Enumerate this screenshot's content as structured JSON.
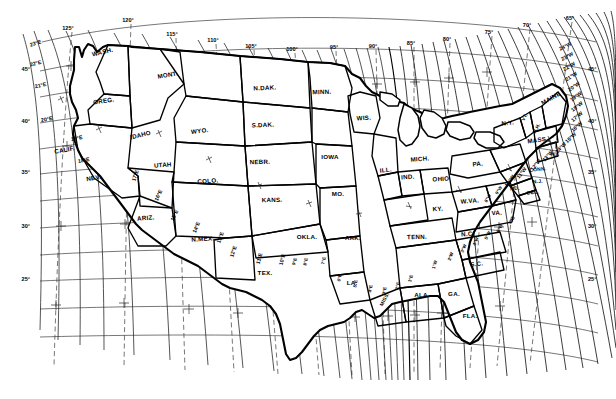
{
  "chart_data": {
    "type": "map",
    "subtitle": "Lines of equal magnetic declination (variation) east and west of true north",
    "projection": "conic",
    "xlabel": "Longitude (West)",
    "ylabel": "Latitude (North)",
    "grid": true,
    "legend_position": "none",
    "xlim": [
      -127,
      -64
    ],
    "ylim": [
      23,
      50
    ],
    "longitude_ticks": [
      "125°",
      "120°",
      "115°",
      "110°",
      "105°",
      "100°",
      "95°",
      "90°",
      "85°",
      "80°",
      "75°",
      "70°",
      "65°"
    ],
    "latitude_ticks_left": [
      "45°",
      "40°",
      "35°",
      "30°",
      "25°"
    ],
    "latitude_ticks_right": [
      "45°",
      "40°",
      "35°",
      "30°",
      "25°"
    ],
    "declination_east_labels": [
      "23°E",
      "22°E",
      "21°E",
      "20°E",
      "19°E",
      "18°E",
      "17°E",
      "16°E",
      "15°E",
      "14°E",
      "13°E",
      "12°E",
      "11°E",
      "10°E",
      "9°E",
      "8°E",
      "7°E",
      "6°E",
      "5°E",
      "4°E",
      "3°E",
      "2°E",
      "1°E"
    ],
    "declination_west_labels": [
      "1°W",
      "2°W",
      "3°W",
      "4°W",
      "5°W",
      "6°W",
      "7°W",
      "8°W",
      "9°W",
      "10°W",
      "11°W",
      "12°W",
      "13°W",
      "14°W",
      "15°W",
      "16°W",
      "17°W",
      "18°W",
      "19°W",
      "20°W",
      "21°W",
      "22°W",
      "23°W",
      "24°W"
    ],
    "agonic_line": "0° — runs from Lake Michigan south through Illinois, western Kentucky, Tennessee and Mississippi to the Gulf Coast",
    "series": [
      {
        "name": "East declination isogonics",
        "values": [
          23,
          22,
          21,
          20,
          19,
          18,
          17,
          16,
          15,
          14,
          13,
          12,
          11,
          10,
          9,
          8,
          7,
          6,
          5,
          4,
          3,
          2,
          1
        ]
      },
      {
        "name": "Agonic line",
        "values": [
          0
        ]
      },
      {
        "name": "West declination isogonics",
        "values": [
          -1,
          -2,
          -3,
          -4,
          -5,
          -6,
          -7,
          -8,
          -9,
          -10,
          -11,
          -12,
          -13,
          -14,
          -15,
          -16,
          -17,
          -18,
          -19,
          -20,
          -21,
          -22,
          -23,
          -24
        ]
      }
    ]
  },
  "axis": {
    "top": [
      {
        "label": "125°",
        "x": 68,
        "y": 30
      },
      {
        "label": "120°",
        "x": 128,
        "y": 22
      },
      {
        "label": "115°",
        "x": 172,
        "y": 36
      },
      {
        "label": "110°",
        "x": 213,
        "y": 42
      },
      {
        "label": "105°",
        "x": 251,
        "y": 48
      },
      {
        "label": "100°",
        "x": 292,
        "y": 51
      },
      {
        "label": "95°",
        "x": 334,
        "y": 49
      },
      {
        "label": "90°",
        "x": 373,
        "y": 48
      },
      {
        "label": "85°",
        "x": 411,
        "y": 45
      },
      {
        "label": "80°",
        "x": 447,
        "y": 41
      },
      {
        "label": "75°",
        "x": 489,
        "y": 34
      },
      {
        "label": "70°",
        "x": 527,
        "y": 27
      },
      {
        "label": "65°",
        "x": 570,
        "y": 20
      }
    ],
    "left": [
      {
        "label": "45°",
        "x": 30,
        "y": 71
      },
      {
        "label": "40°",
        "x": 30,
        "y": 123
      },
      {
        "label": "35°",
        "x": 30,
        "y": 174
      },
      {
        "label": "30°",
        "x": 30,
        "y": 228
      },
      {
        "label": "25°",
        "x": 30,
        "y": 281
      }
    ],
    "right": [
      {
        "label": "45°",
        "x": 588,
        "y": 71
      },
      {
        "label": "40°",
        "x": 588,
        "y": 123
      },
      {
        "label": "35°",
        "x": 588,
        "y": 174
      },
      {
        "label": "30°",
        "x": 588,
        "y": 228
      },
      {
        "label": "25°",
        "x": 588,
        "y": 281
      }
    ]
  },
  "states": [
    {
      "abbr": "WASH.",
      "x": 103,
      "y": 54,
      "rot": -13,
      "size": "n"
    },
    {
      "abbr": "OREG.",
      "x": 104,
      "y": 103,
      "rot": -8,
      "size": "n"
    },
    {
      "abbr": "CALIF.",
      "x": 65,
      "y": 152,
      "rot": -10,
      "size": "n"
    },
    {
      "abbr": "NEV.",
      "x": 94,
      "y": 180,
      "rot": -10,
      "size": "n"
    },
    {
      "abbr": "IDAHO",
      "x": 141,
      "y": 137,
      "rot": -14,
      "size": "n"
    },
    {
      "abbr": "MONT.",
      "x": 168,
      "y": 77,
      "rot": -10,
      "size": "n"
    },
    {
      "abbr": "WYO.",
      "x": 200,
      "y": 133,
      "rot": -6,
      "size": "n"
    },
    {
      "abbr": "UTAH",
      "x": 163,
      "y": 167,
      "rot": -5,
      "size": "n"
    },
    {
      "abbr": "COLO.",
      "x": 208,
      "y": 183,
      "rot": -4,
      "size": "n"
    },
    {
      "abbr": "ARIZ.",
      "x": 146,
      "y": 220,
      "rot": -5,
      "size": "n"
    },
    {
      "abbr": "N.MEX.",
      "x": 203,
      "y": 241,
      "rot": -4,
      "size": "n"
    },
    {
      "abbr": "N.DAK.",
      "x": 265,
      "y": 90,
      "rot": -3,
      "size": "n"
    },
    {
      "abbr": "S.DAK.",
      "x": 263,
      "y": 127,
      "rot": -2,
      "size": "n"
    },
    {
      "abbr": "NEBR.",
      "x": 260,
      "y": 164,
      "rot": -2,
      "size": "n"
    },
    {
      "abbr": "KANS.",
      "x": 272,
      "y": 202,
      "rot": -1,
      "size": "n"
    },
    {
      "abbr": "OKLA.",
      "x": 307,
      "y": 239,
      "rot": 0,
      "size": "n"
    },
    {
      "abbr": "TEX.",
      "x": 265,
      "y": 275,
      "rot": 0,
      "size": "n"
    },
    {
      "abbr": "MINN.",
      "x": 322,
      "y": 94,
      "rot": -2,
      "size": "n"
    },
    {
      "abbr": "IOWA",
      "x": 330,
      "y": 159,
      "rot": 0,
      "size": "n"
    },
    {
      "abbr": "MO.",
      "x": 338,
      "y": 196,
      "rot": 0,
      "size": "n"
    },
    {
      "abbr": "ARK.",
      "x": 353,
      "y": 240,
      "rot": 0,
      "size": "n"
    },
    {
      "abbr": "LA.",
      "x": 352,
      "y": 285,
      "rot": 0,
      "size": "n"
    },
    {
      "abbr": "MISS.",
      "x": 386,
      "y": 300,
      "rot": -62,
      "size": "sm"
    },
    {
      "abbr": "WIS.",
      "x": 364,
      "y": 120,
      "rot": -4,
      "size": "n"
    },
    {
      "abbr": "ILL.",
      "x": 386,
      "y": 172,
      "rot": -6,
      "size": "n"
    },
    {
      "abbr": "IND.",
      "x": 408,
      "y": 179,
      "rot": -4,
      "size": "n"
    },
    {
      "abbr": "MICH.",
      "x": 420,
      "y": 161,
      "rot": -4,
      "size": "n"
    },
    {
      "abbr": "OHIO",
      "x": 441,
      "y": 181,
      "rot": -3,
      "size": "n"
    },
    {
      "abbr": "KY.",
      "x": 438,
      "y": 211,
      "rot": -4,
      "size": "n"
    },
    {
      "abbr": "TENN.",
      "x": 417,
      "y": 239,
      "rot": -2,
      "size": "n"
    },
    {
      "abbr": "ALA.",
      "x": 422,
      "y": 297,
      "rot": 0,
      "size": "n"
    },
    {
      "abbr": "GA.",
      "x": 454,
      "y": 296,
      "rot": 0,
      "size": "n"
    },
    {
      "abbr": "FLA.",
      "x": 470,
      "y": 318,
      "rot": 0,
      "size": "n"
    },
    {
      "abbr": "S.C.",
      "x": 477,
      "y": 266,
      "rot": -6,
      "size": "n"
    },
    {
      "abbr": "N.C.",
      "x": 468,
      "y": 236,
      "rot": -4,
      "size": "n"
    },
    {
      "abbr": "VA.",
      "x": 497,
      "y": 215,
      "rot": -4,
      "size": "n"
    },
    {
      "abbr": "W.VA.",
      "x": 470,
      "y": 203,
      "rot": -4,
      "size": "n"
    },
    {
      "abbr": "PA.",
      "x": 478,
      "y": 166,
      "rot": -5,
      "size": "n"
    },
    {
      "abbr": "N.Y.",
      "x": 508,
      "y": 125,
      "rot": -7,
      "size": "n"
    },
    {
      "abbr": "VT.",
      "x": 526,
      "y": 118,
      "rot": -62,
      "size": "sm"
    },
    {
      "abbr": "N.H.",
      "x": 538,
      "y": 129,
      "rot": -62,
      "size": "sm"
    },
    {
      "abbr": "MAINE",
      "x": 552,
      "y": 100,
      "rot": -30,
      "size": "n"
    },
    {
      "abbr": "MASS.",
      "x": 538,
      "y": 142,
      "rot": -8,
      "size": "n"
    },
    {
      "abbr": "CONN.",
      "x": 538,
      "y": 171,
      "rot": -6,
      "size": "sm"
    },
    {
      "abbr": "R.I.",
      "x": 555,
      "y": 156,
      "rot": -6,
      "size": "sm"
    },
    {
      "abbr": "N.J.",
      "x": 538,
      "y": 183,
      "rot": -6,
      "size": "sm"
    },
    {
      "abbr": "DEL.",
      "x": 533,
      "y": 194,
      "rot": -6,
      "size": "sm"
    },
    {
      "abbr": "MD.",
      "x": 515,
      "y": 190,
      "rot": -6,
      "size": "sm"
    }
  ],
  "isogonic_labels": [
    {
      "label": "23°E",
      "x": 36,
      "y": 45,
      "rot": -17
    },
    {
      "label": "22°E",
      "x": 36,
      "y": 65,
      "rot": -14
    },
    {
      "label": "21°E",
      "x": 41,
      "y": 87,
      "rot": -13
    },
    {
      "label": "20°E",
      "x": 47,
      "y": 121,
      "rot": -10
    },
    {
      "label": "19°E",
      "x": 77,
      "y": 140,
      "rot": -10
    },
    {
      "label": "18°E",
      "x": 84,
      "y": 162,
      "rot": -10
    },
    {
      "label": "17°E",
      "x": 137,
      "y": 176,
      "rot": -72
    },
    {
      "label": "16°E",
      "x": 160,
      "y": 196,
      "rot": -66
    },
    {
      "label": "15°E",
      "x": 176,
      "y": 216,
      "rot": -66
    },
    {
      "label": "14°E",
      "x": 198,
      "y": 228,
      "rot": -68
    },
    {
      "label": "13°E",
      "x": 222,
      "y": 238,
      "rot": -70
    },
    {
      "label": "12°E",
      "x": 235,
      "y": 252,
      "rot": -72
    },
    {
      "label": "11°E",
      "x": 261,
      "y": 259,
      "rot": -74
    },
    {
      "label": "10°E",
      "x": 284,
      "y": 260,
      "rot": -76
    },
    {
      "label": "9°E",
      "x": 296,
      "y": 262,
      "rot": -76
    },
    {
      "label": "8°E",
      "x": 307,
      "y": 262,
      "rot": -78
    },
    {
      "label": "7°E",
      "x": 325,
      "y": 261,
      "rot": -78
    },
    {
      "label": "6°E",
      "x": 341,
      "y": 278,
      "rot": -80
    },
    {
      "label": "5°E",
      "x": 357,
      "y": 284,
      "rot": -80
    },
    {
      "label": "4°E",
      "x": 372,
      "y": 289,
      "rot": -80
    },
    {
      "label": "3°E",
      "x": 386,
      "y": 291,
      "rot": -80
    },
    {
      "label": "2°E",
      "x": 399,
      "y": 286,
      "rot": -78
    },
    {
      "label": "1°E",
      "x": 412,
      "y": 279,
      "rot": -76
    },
    {
      "label": "1°W",
      "x": 436,
      "y": 265,
      "rot": -72
    },
    {
      "label": "2°W",
      "x": 452,
      "y": 257,
      "rot": -70
    },
    {
      "label": "3°W",
      "x": 465,
      "y": 249,
      "rot": -68
    },
    {
      "label": "4°W",
      "x": 477,
      "y": 242,
      "rot": -66
    },
    {
      "label": "5°W",
      "x": 489,
      "y": 236,
      "rot": -64
    },
    {
      "label": "6°W",
      "x": 501,
      "y": 229,
      "rot": -62
    },
    {
      "label": "7°W",
      "x": 513,
      "y": 221,
      "rot": -60
    },
    {
      "label": "8°W",
      "x": 489,
      "y": 199,
      "rot": -58
    },
    {
      "label": "9°W",
      "x": 500,
      "y": 191,
      "rot": -56
    },
    {
      "label": "10°W",
      "x": 511,
      "y": 182,
      "rot": -54
    },
    {
      "label": "11°W",
      "x": 523,
      "y": 174,
      "rot": -52
    },
    {
      "label": "12°W",
      "x": 537,
      "y": 166,
      "rot": -50
    },
    {
      "label": "13°W",
      "x": 549,
      "y": 157,
      "rot": -48
    },
    {
      "label": "14°W",
      "x": 562,
      "y": 149,
      "rot": -46
    },
    {
      "label": "15°W",
      "x": 572,
      "y": 139,
      "rot": -44
    },
    {
      "label": "16°W",
      "x": 578,
      "y": 128,
      "rot": -42
    },
    {
      "label": "17°W",
      "x": 578,
      "y": 118,
      "rot": -40
    },
    {
      "label": "18°W",
      "x": 578,
      "y": 108,
      "rot": -38
    },
    {
      "label": "19°W",
      "x": 577,
      "y": 98,
      "rot": -36
    },
    {
      "label": "20°W",
      "x": 575,
      "y": 88,
      "rot": -34
    },
    {
      "label": "21°W",
      "x": 572,
      "y": 78,
      "rot": -32
    },
    {
      "label": "22°W",
      "x": 570,
      "y": 68,
      "rot": -30
    },
    {
      "label": "23°W",
      "x": 568,
      "y": 58,
      "rot": -28
    },
    {
      "label": "24°W",
      "x": 566,
      "y": 48,
      "rot": -26
    }
  ]
}
